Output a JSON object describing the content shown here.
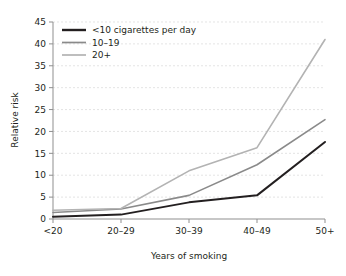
{
  "chart_data": {
    "type": "line",
    "title": "",
    "xlabel": "Years of smoking",
    "ylabel": "Relative risk",
    "categories": [
      "<20",
      "20–29",
      "30–39",
      "40–49",
      "50+"
    ],
    "ylim": [
      0,
      45
    ],
    "ytick_step": 5,
    "yticks": [
      0,
      5,
      10,
      15,
      20,
      25,
      30,
      35,
      40,
      45
    ],
    "ytick_labels": [
      "0",
      "5",
      "10",
      "15",
      "20",
      "25",
      "30",
      "35",
      "40",
      "45"
    ],
    "grid": "horizontal-dashed",
    "legend_position": "top-left-inside",
    "series": [
      {
        "name": "<10 cigarettes per day",
        "color": "#231f20",
        "values": [
          0.5,
          1.0,
          3.8,
          5.4,
          17.6
        ]
      },
      {
        "name": "10–19",
        "color": "#8a8a8a",
        "values": [
          1.5,
          2.3,
          5.4,
          12.4,
          22.7
        ]
      },
      {
        "name": "20+",
        "color": "#b3b3b3",
        "values": [
          2.0,
          2.4,
          11.0,
          16.3,
          41.0
        ]
      }
    ]
  },
  "axes": {
    "y_axis_label": "Relative risk",
    "x_axis_label": "Years of smoking",
    "axis_color": "#8f8f8f",
    "grid_color": "#d8d8d8"
  },
  "legend": {
    "entries": [
      {
        "label": "<10 cigarettes per day",
        "color": "#231f20"
      },
      {
        "label": "10–19",
        "color": "#8a8a8a"
      },
      {
        "label": "20+",
        "color": "#b3b3b3"
      }
    ]
  }
}
